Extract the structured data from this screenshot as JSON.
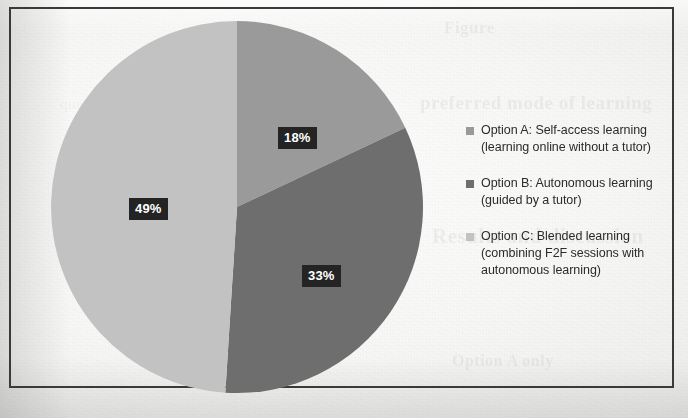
{
  "document": {
    "kind": "scanned-page-pie-chart",
    "border_color": "#3a3a3a",
    "paper_color": "#f3f3f1"
  },
  "showthrough": {
    "line_a": "Figure",
    "line_b": "preferred mode of learning",
    "line_c": "Results and discussion",
    "line_d": "Option A only",
    "line_e": "questionnaire responses"
  },
  "chart_data": {
    "type": "pie",
    "title": "",
    "subtitle": "",
    "xlabel": "",
    "ylabel": "",
    "grid": false,
    "legend_position": "right",
    "start_angle_deg": 0,
    "direction": "clockwise",
    "categories": [
      "Option A: Self-access learning (learning online without a tutor)",
      "Option B: Autonomous learning (guided by a tutor)",
      "Option C: Blended learning (combining F2F sessions with autonomous learning)"
    ],
    "values": [
      18,
      33,
      49
    ],
    "value_unit": "%",
    "data_labels": [
      "18%",
      "33%",
      "49%"
    ],
    "colors": [
      "#9a9a9a",
      "#6e6e6e",
      "#c2c2c2"
    ],
    "data_label_bg": "#242424",
    "data_label_fg": "#ffffff"
  },
  "legend": {
    "items": [
      {
        "swatch": "#9a9a9a",
        "line1": "Option A: Self-access learning",
        "line2": "(learning online without a tutor)"
      },
      {
        "swatch": "#6e6e6e",
        "line1": "Option B: Autonomous learning",
        "line2": "(guided by a tutor)"
      },
      {
        "swatch": "#c2c2c2",
        "line1": "Option C: Blended learning",
        "line2": "(combining F2F sessions with",
        "line3": "autonomous learning)"
      }
    ]
  }
}
